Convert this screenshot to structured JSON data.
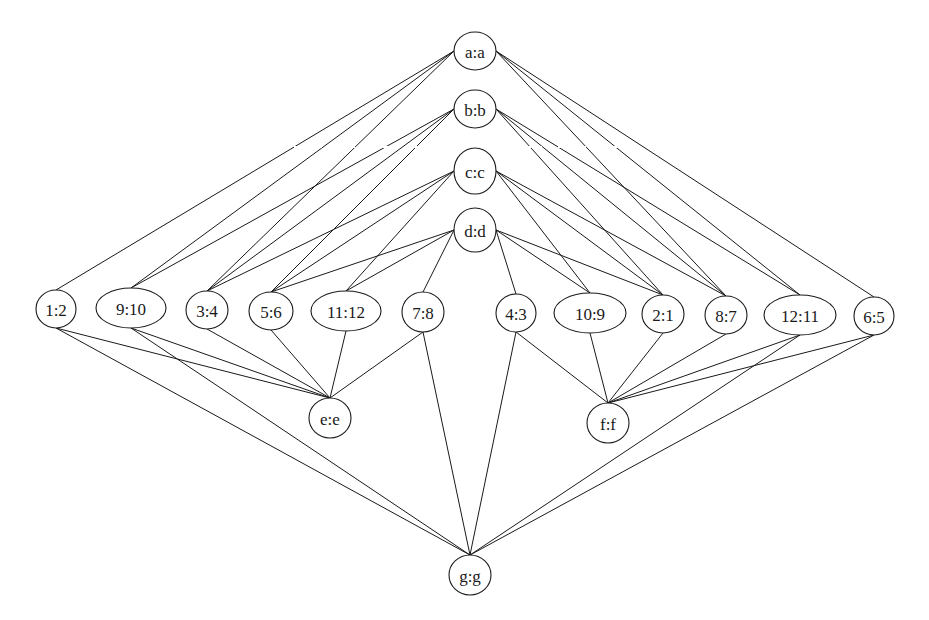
{
  "diagram": {
    "type": "lattice-graph",
    "stroke_color": "#1a1a1a",
    "background": "#ffffff",
    "nodes": [
      {
        "id": "a",
        "label": "a:a",
        "x": 475,
        "y": 51,
        "rx": 21,
        "ry": 19,
        "row": "top"
      },
      {
        "id": "b",
        "label": "b:b",
        "x": 475,
        "y": 109,
        "rx": 21,
        "ry": 19,
        "row": "top"
      },
      {
        "id": "c",
        "label": "c:c",
        "x": 475,
        "y": 171,
        "rx": 21,
        "ry": 23,
        "row": "top"
      },
      {
        "id": "d",
        "label": "d:d",
        "x": 475,
        "y": 230,
        "rx": 21,
        "ry": 22,
        "row": "top"
      },
      {
        "id": "n1_2",
        "label": "1:2",
        "x": 56,
        "y": 309,
        "rx": 20,
        "ry": 19,
        "row": "middle"
      },
      {
        "id": "n9_10",
        "label": "9:10",
        "x": 131,
        "y": 308,
        "rx": 35,
        "ry": 20,
        "row": "middle"
      },
      {
        "id": "n3_4",
        "label": "3:4",
        "x": 207,
        "y": 310,
        "rx": 21,
        "ry": 19,
        "row": "middle"
      },
      {
        "id": "n5_6",
        "label": "5:6",
        "x": 271,
        "y": 311,
        "rx": 22,
        "ry": 19,
        "row": "middle"
      },
      {
        "id": "n11_12",
        "label": "11:12",
        "x": 346,
        "y": 311,
        "rx": 35,
        "ry": 20,
        "row": "middle"
      },
      {
        "id": "n7_8",
        "label": "7:8",
        "x": 423,
        "y": 312,
        "rx": 21,
        "ry": 20,
        "row": "middle"
      },
      {
        "id": "n4_3",
        "label": "4:3",
        "x": 516,
        "y": 313,
        "rx": 20,
        "ry": 19,
        "row": "middle"
      },
      {
        "id": "n10_9",
        "label": "10:9",
        "x": 590,
        "y": 313,
        "rx": 36,
        "ry": 20,
        "row": "middle"
      },
      {
        "id": "n2_1",
        "label": "2:1",
        "x": 663,
        "y": 314,
        "rx": 21,
        "ry": 19,
        "row": "middle"
      },
      {
        "id": "n8_7",
        "label": "8:7",
        "x": 726,
        "y": 315,
        "rx": 21,
        "ry": 19,
        "row": "middle"
      },
      {
        "id": "n12_11",
        "label": "12:11",
        "x": 800,
        "y": 315,
        "rx": 36,
        "ry": 20,
        "row": "middle"
      },
      {
        "id": "n6_5",
        "label": "6:5",
        "x": 874,
        "y": 316,
        "rx": 20,
        "ry": 19,
        "row": "middle"
      },
      {
        "id": "e",
        "label": "e:e",
        "x": 330,
        "y": 418,
        "rx": 21,
        "ry": 20,
        "row": "lower"
      },
      {
        "id": "f",
        "label": "f:f",
        "x": 608,
        "y": 423,
        "rx": 21,
        "ry": 20,
        "row": "lower"
      },
      {
        "id": "g",
        "label": "g:g",
        "x": 470,
        "y": 575,
        "rx": 21,
        "ry": 20,
        "row": "bottom"
      }
    ],
    "edges": [
      [
        "a",
        "n1_2"
      ],
      [
        "a",
        "n9_10"
      ],
      [
        "a",
        "n3_4"
      ],
      [
        "a",
        "n8_7"
      ],
      [
        "a",
        "n12_11"
      ],
      [
        "a",
        "n6_5"
      ],
      [
        "b",
        "n9_10"
      ],
      [
        "b",
        "n3_4"
      ],
      [
        "b",
        "n5_6"
      ],
      [
        "b",
        "n2_1"
      ],
      [
        "b",
        "n8_7"
      ],
      [
        "b",
        "n12_11"
      ],
      [
        "c",
        "n3_4"
      ],
      [
        "c",
        "n5_6"
      ],
      [
        "c",
        "n11_12"
      ],
      [
        "c",
        "n10_9"
      ],
      [
        "c",
        "n2_1"
      ],
      [
        "c",
        "n8_7"
      ],
      [
        "d",
        "n5_6"
      ],
      [
        "d",
        "n11_12"
      ],
      [
        "d",
        "n7_8"
      ],
      [
        "d",
        "n4_3"
      ],
      [
        "d",
        "n10_9"
      ],
      [
        "d",
        "n2_1"
      ],
      [
        "n1_2",
        "e"
      ],
      [
        "n9_10",
        "e"
      ],
      [
        "n3_4",
        "e"
      ],
      [
        "n5_6",
        "e"
      ],
      [
        "n11_12",
        "e"
      ],
      [
        "n7_8",
        "e"
      ],
      [
        "n4_3",
        "f"
      ],
      [
        "n10_9",
        "f"
      ],
      [
        "n2_1",
        "f"
      ],
      [
        "n8_7",
        "f"
      ],
      [
        "n12_11",
        "f"
      ],
      [
        "n6_5",
        "f"
      ],
      [
        "n1_2",
        "g"
      ],
      [
        "n9_10",
        "g"
      ],
      [
        "n7_8",
        "g"
      ],
      [
        "n4_3",
        "g"
      ],
      [
        "n12_11",
        "g"
      ],
      [
        "n6_5",
        "g"
      ]
    ]
  }
}
